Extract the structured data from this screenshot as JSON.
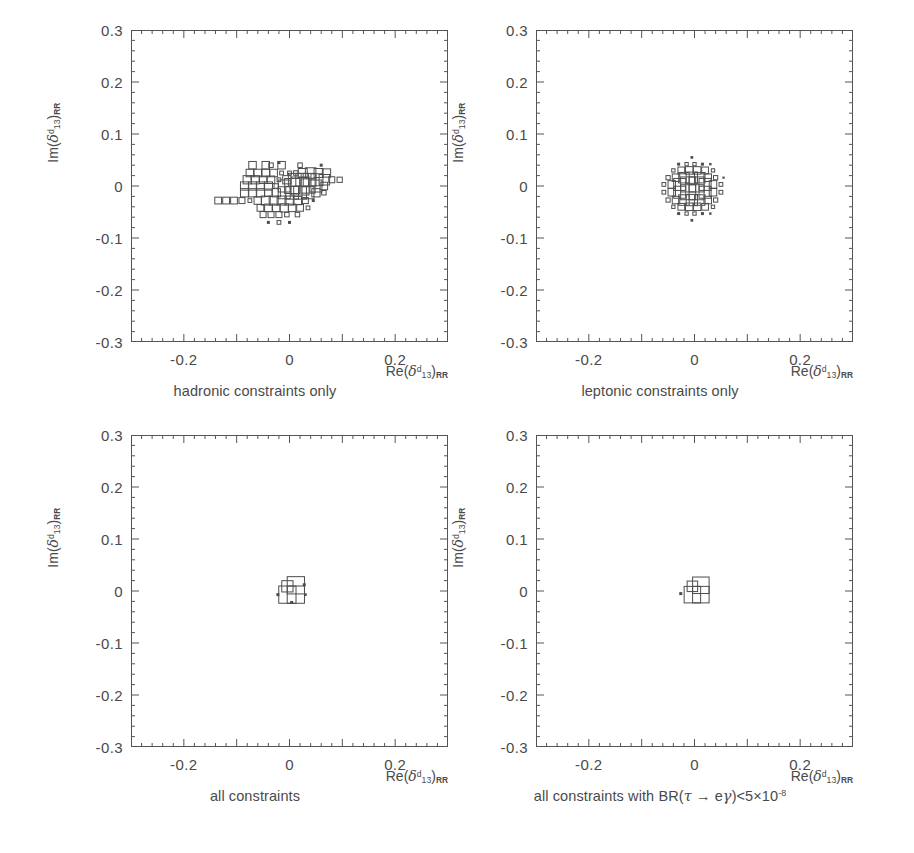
{
  "figure": {
    "axis": {
      "xlabel_parts": {
        "re": "Re(",
        "delta": "δ",
        "sup": "d",
        "sub": "13",
        "close": ")",
        "rr": "RR"
      },
      "ylabel_parts": {
        "im": "Im(",
        "delta": "δ",
        "sup": "d",
        "sub": "13",
        "close": ")",
        "rr": "RR"
      },
      "xticks": [
        "-0.2",
        "0",
        "0.2"
      ],
      "xtick_values": [
        -0.2,
        0,
        0.2
      ],
      "yticks": [
        "0.3",
        "0.2",
        "0.1",
        "0",
        "-0.1",
        "-0.2",
        "-0.3"
      ],
      "ytick_values": [
        0.3,
        0.2,
        0.1,
        0,
        -0.1,
        -0.2,
        -0.3
      ],
      "xlim": [
        -0.3,
        0.3
      ],
      "ylim": [
        -0.3,
        0.3
      ],
      "minor_ticks_per_major": 5
    },
    "panels": [
      {
        "id": "hadronic",
        "caption": "hadronic constraints only"
      },
      {
        "id": "leptonic",
        "caption": "leptonic constraints only"
      },
      {
        "id": "all",
        "caption": "all constraints"
      },
      {
        "id": "all-tau-egamma",
        "caption_prefix": "all constraints with BR(",
        "caption_tau": "τ",
        "caption_arrow": "→",
        "caption_egamma": "eγ",
        "caption_mid": ")<5×10",
        "caption_exp": "-8"
      }
    ],
    "colors": {
      "line": "#555555",
      "text": "#4a4a4a",
      "box": "#4d4d4d",
      "background": "#ffffff"
    }
  },
  "chart_data": [
    {
      "type": "heatmap",
      "title": "hadronic constraints only",
      "xlabel": "Re(delta^d_13)_RR",
      "ylabel": "Im(delta^d_13)_RR",
      "xlim": [
        -0.3,
        0.3
      ],
      "ylim": [
        -0.3,
        0.3
      ],
      "bin_size": 0.01,
      "style": "root-box-plot",
      "note": "Box side length proportional to bin content; irregular off-centre blob extending from Re=-0.14 to Re=+0.10, Im=-0.09 to Im=+0.05",
      "boxes": [
        {
          "x": -0.07,
          "y": 0.04,
          "w": 0.5
        },
        {
          "x": -0.045,
          "y": 0.04,
          "w": 0.5
        },
        {
          "x": -0.035,
          "y": 0.04,
          "w": 0.3
        },
        {
          "x": -0.02,
          "y": 0.045,
          "w": 0.2
        },
        {
          "x": -0.015,
          "y": 0.04,
          "w": 0.5
        },
        {
          "x": 0.02,
          "y": 0.04,
          "w": 0.3
        },
        {
          "x": 0.06,
          "y": 0.04,
          "w": 0.2
        },
        {
          "x": -0.075,
          "y": 0.025,
          "w": 0.5
        },
        {
          "x": -0.06,
          "y": 0.025,
          "w": 0.5
        },
        {
          "x": -0.045,
          "y": 0.025,
          "w": 0.5
        },
        {
          "x": -0.03,
          "y": 0.025,
          "w": 0.5
        },
        {
          "x": -0.015,
          "y": 0.025,
          "w": 0.25
        },
        {
          "x": 0.0,
          "y": 0.025,
          "w": 0.25
        },
        {
          "x": 0.012,
          "y": 0.025,
          "w": 0.3
        },
        {
          "x": 0.025,
          "y": 0.025,
          "w": 0.6
        },
        {
          "x": 0.04,
          "y": 0.025,
          "w": 0.7
        },
        {
          "x": 0.055,
          "y": 0.025,
          "w": 0.6
        },
        {
          "x": 0.07,
          "y": 0.025,
          "w": 0.55
        },
        {
          "x": -0.08,
          "y": 0.012,
          "w": 0.55
        },
        {
          "x": -0.065,
          "y": 0.012,
          "w": 0.55
        },
        {
          "x": -0.05,
          "y": 0.012,
          "w": 0.5
        },
        {
          "x": -0.035,
          "y": 0.012,
          "w": 0.5
        },
        {
          "x": -0.02,
          "y": 0.012,
          "w": 0.25
        },
        {
          "x": -0.005,
          "y": 0.012,
          "w": 0.55
        },
        {
          "x": 0.01,
          "y": 0.012,
          "w": 0.85
        },
        {
          "x": 0.024,
          "y": 0.012,
          "w": 0.85
        },
        {
          "x": 0.038,
          "y": 0.012,
          "w": 0.85
        },
        {
          "x": 0.052,
          "y": 0.012,
          "w": 0.8
        },
        {
          "x": 0.066,
          "y": 0.012,
          "w": 0.7
        },
        {
          "x": 0.08,
          "y": 0.012,
          "w": 0.4
        },
        {
          "x": 0.095,
          "y": 0.012,
          "w": 0.35
        },
        {
          "x": -0.085,
          "y": 0.0,
          "w": 0.55
        },
        {
          "x": -0.07,
          "y": 0.0,
          "w": 0.55
        },
        {
          "x": -0.055,
          "y": 0.0,
          "w": 0.55
        },
        {
          "x": -0.04,
          "y": 0.0,
          "w": 0.55
        },
        {
          "x": -0.025,
          "y": 0.0,
          "w": 0.3
        },
        {
          "x": -0.01,
          "y": 0.0,
          "w": 0.8
        },
        {
          "x": 0.005,
          "y": 0.0,
          "w": 1.0
        },
        {
          "x": 0.02,
          "y": 0.0,
          "w": 1.2
        },
        {
          "x": 0.035,
          "y": 0.0,
          "w": 0.95
        },
        {
          "x": 0.05,
          "y": 0.0,
          "w": 0.8
        },
        {
          "x": 0.065,
          "y": 0.0,
          "w": 0.5
        },
        {
          "x": -0.085,
          "y": -0.013,
          "w": 0.55
        },
        {
          "x": -0.07,
          "y": -0.013,
          "w": 0.55
        },
        {
          "x": -0.055,
          "y": -0.013,
          "w": 0.55
        },
        {
          "x": -0.04,
          "y": -0.013,
          "w": 0.5
        },
        {
          "x": -0.025,
          "y": -0.013,
          "w": 0.55
        },
        {
          "x": -0.01,
          "y": -0.013,
          "w": 0.8
        },
        {
          "x": 0.005,
          "y": -0.013,
          "w": 0.85
        },
        {
          "x": 0.02,
          "y": -0.013,
          "w": 0.85
        },
        {
          "x": 0.035,
          "y": -0.013,
          "w": 0.8
        },
        {
          "x": 0.05,
          "y": -0.013,
          "w": 0.55
        },
        {
          "x": 0.065,
          "y": -0.013,
          "w": 0.3
        },
        {
          "x": -0.135,
          "y": -0.028,
          "w": 0.45
        },
        {
          "x": -0.12,
          "y": -0.028,
          "w": 0.45
        },
        {
          "x": -0.105,
          "y": -0.028,
          "w": 0.45
        },
        {
          "x": -0.09,
          "y": -0.028,
          "w": 0.4
        },
        {
          "x": -0.075,
          "y": -0.028,
          "w": 0.25
        },
        {
          "x": -0.06,
          "y": -0.028,
          "w": 0.5
        },
        {
          "x": -0.045,
          "y": -0.028,
          "w": 0.6
        },
        {
          "x": -0.03,
          "y": -0.028,
          "w": 0.6
        },
        {
          "x": -0.015,
          "y": -0.028,
          "w": 0.6
        },
        {
          "x": 0.0,
          "y": -0.028,
          "w": 0.6
        },
        {
          "x": 0.015,
          "y": -0.028,
          "w": 0.55
        },
        {
          "x": 0.03,
          "y": -0.028,
          "w": 0.4
        },
        {
          "x": 0.045,
          "y": -0.028,
          "w": 0.2
        },
        {
          "x": -0.055,
          "y": -0.042,
          "w": 0.45
        },
        {
          "x": -0.04,
          "y": -0.042,
          "w": 0.5
        },
        {
          "x": -0.025,
          "y": -0.042,
          "w": 0.5
        },
        {
          "x": -0.01,
          "y": -0.042,
          "w": 0.55
        },
        {
          "x": 0.005,
          "y": -0.042,
          "w": 0.5
        },
        {
          "x": 0.02,
          "y": -0.042,
          "w": 0.45
        },
        {
          "x": 0.035,
          "y": -0.042,
          "w": 0.25
        },
        {
          "x": -0.05,
          "y": -0.055,
          "w": 0.4
        },
        {
          "x": -0.035,
          "y": -0.055,
          "w": 0.4
        },
        {
          "x": -0.02,
          "y": -0.055,
          "w": 0.4
        },
        {
          "x": -0.005,
          "y": -0.055,
          "w": 0.3
        },
        {
          "x": 0.015,
          "y": -0.055,
          "w": 0.3
        },
        {
          "x": -0.04,
          "y": -0.07,
          "w": 0.2
        },
        {
          "x": -0.02,
          "y": -0.07,
          "w": 0.25
        },
        {
          "x": 0.0,
          "y": -0.07,
          "w": 0.2
        }
      ]
    },
    {
      "type": "heatmap",
      "title": "leptonic constraints only",
      "xlabel": "Re(delta^d_13)_RR",
      "ylabel": "Im(delta^d_13)_RR",
      "xlim": [
        -0.3,
        0.3
      ],
      "ylim": [
        -0.3,
        0.3
      ],
      "bin_size": 0.01,
      "style": "root-box-plot",
      "note": "Compact, nearly circular symmetric blob centred at origin, radius ~0.05",
      "boxes": [
        {
          "x": -0.005,
          "y": 0.055,
          "w": 0.18
        },
        {
          "x": -0.03,
          "y": 0.042,
          "w": 0.2
        },
        {
          "x": -0.015,
          "y": 0.042,
          "w": 0.22
        },
        {
          "x": 0.0,
          "y": 0.042,
          "w": 0.22
        },
        {
          "x": 0.015,
          "y": 0.042,
          "w": 0.2
        },
        {
          "x": 0.03,
          "y": 0.042,
          "w": 0.16
        },
        {
          "x": -0.04,
          "y": 0.03,
          "w": 0.22
        },
        {
          "x": -0.025,
          "y": 0.03,
          "w": 0.45
        },
        {
          "x": -0.01,
          "y": 0.03,
          "w": 0.5
        },
        {
          "x": 0.005,
          "y": 0.03,
          "w": 0.5
        },
        {
          "x": 0.02,
          "y": 0.03,
          "w": 0.45
        },
        {
          "x": 0.035,
          "y": 0.03,
          "w": 0.22
        },
        {
          "x": -0.05,
          "y": 0.016,
          "w": 0.28
        },
        {
          "x": -0.035,
          "y": 0.016,
          "w": 0.5
        },
        {
          "x": -0.02,
          "y": 0.016,
          "w": 0.7
        },
        {
          "x": -0.005,
          "y": 0.016,
          "w": 0.75
        },
        {
          "x": 0.01,
          "y": 0.016,
          "w": 0.7
        },
        {
          "x": 0.025,
          "y": 0.016,
          "w": 0.5
        },
        {
          "x": 0.04,
          "y": 0.016,
          "w": 0.28
        },
        {
          "x": 0.055,
          "y": 0.016,
          "w": 0.15
        },
        {
          "x": -0.058,
          "y": 0.003,
          "w": 0.25
        },
        {
          "x": -0.043,
          "y": 0.003,
          "w": 0.5
        },
        {
          "x": -0.028,
          "y": 0.003,
          "w": 0.8
        },
        {
          "x": -0.012,
          "y": 0.003,
          "w": 1.0
        },
        {
          "x": 0.004,
          "y": 0.003,
          "w": 1.0
        },
        {
          "x": 0.02,
          "y": 0.003,
          "w": 0.8
        },
        {
          "x": 0.035,
          "y": 0.003,
          "w": 0.5
        },
        {
          "x": 0.05,
          "y": 0.003,
          "w": 0.25
        },
        {
          "x": -0.058,
          "y": -0.012,
          "w": 0.25
        },
        {
          "x": -0.043,
          "y": -0.012,
          "w": 0.5
        },
        {
          "x": -0.028,
          "y": -0.012,
          "w": 0.8
        },
        {
          "x": -0.012,
          "y": -0.012,
          "w": 1.0
        },
        {
          "x": 0.004,
          "y": -0.012,
          "w": 1.0
        },
        {
          "x": 0.02,
          "y": -0.012,
          "w": 0.8
        },
        {
          "x": 0.035,
          "y": -0.012,
          "w": 0.5
        },
        {
          "x": 0.05,
          "y": -0.012,
          "w": 0.25
        },
        {
          "x": -0.05,
          "y": -0.027,
          "w": 0.28
        },
        {
          "x": -0.035,
          "y": -0.027,
          "w": 0.5
        },
        {
          "x": -0.02,
          "y": -0.027,
          "w": 0.7
        },
        {
          "x": -0.005,
          "y": -0.027,
          "w": 0.75
        },
        {
          "x": 0.01,
          "y": -0.027,
          "w": 0.7
        },
        {
          "x": 0.025,
          "y": -0.027,
          "w": 0.5
        },
        {
          "x": 0.04,
          "y": -0.027,
          "w": 0.28
        },
        {
          "x": -0.04,
          "y": -0.04,
          "w": 0.22
        },
        {
          "x": -0.025,
          "y": -0.04,
          "w": 0.45
        },
        {
          "x": -0.01,
          "y": -0.04,
          "w": 0.5
        },
        {
          "x": 0.005,
          "y": -0.04,
          "w": 0.5
        },
        {
          "x": 0.02,
          "y": -0.04,
          "w": 0.45
        },
        {
          "x": 0.035,
          "y": -0.04,
          "w": 0.22
        },
        {
          "x": -0.03,
          "y": -0.053,
          "w": 0.2
        },
        {
          "x": -0.015,
          "y": -0.053,
          "w": 0.22
        },
        {
          "x": 0.0,
          "y": -0.053,
          "w": 0.22
        },
        {
          "x": 0.015,
          "y": -0.053,
          "w": 0.2
        },
        {
          "x": 0.03,
          "y": -0.053,
          "w": 0.16
        },
        {
          "x": -0.005,
          "y": -0.066,
          "w": 0.18
        }
      ]
    },
    {
      "type": "heatmap",
      "title": "all constraints",
      "xlabel": "Re(delta^d_13)_RR",
      "ylabel": "Im(delta^d_13)_RR",
      "xlim": [
        -0.3,
        0.3
      ],
      "ylim": [
        -0.3,
        0.3
      ],
      "bin_size": 0.01,
      "style": "root-box-plot",
      "note": "Very small cluster of 3-4 bins at the origin",
      "boxes": [
        {
          "x": -0.004,
          "y": 0.009,
          "w": 0.75
        },
        {
          "x": 0.012,
          "y": 0.011,
          "w": 1.15
        },
        {
          "x": -0.004,
          "y": -0.007,
          "w": 1.15
        },
        {
          "x": 0.012,
          "y": -0.007,
          "w": 1.15
        },
        {
          "x": 0.028,
          "y": 0.012,
          "w": 0.2
        },
        {
          "x": -0.022,
          "y": -0.007,
          "w": 0.2
        },
        {
          "x": 0.03,
          "y": -0.007,
          "w": 0.18
        },
        {
          "x": 0.004,
          "y": -0.022,
          "w": 0.2
        }
      ]
    },
    {
      "type": "heatmap",
      "title": "all constraints with BR(tau -> e gamma) < 5e-8",
      "xlabel": "Re(delta^d_13)_RR",
      "ylabel": "Im(delta^d_13)_RR",
      "xlim": [
        -0.3,
        0.3
      ],
      "ylim": [
        -0.3,
        0.3
      ],
      "bin_size": 0.01,
      "style": "root-box-plot",
      "note": "Very small cluster of 3-4 bins at the origin, slightly sparser than panel 3",
      "boxes": [
        {
          "x": -0.004,
          "y": 0.009,
          "w": 0.7
        },
        {
          "x": 0.012,
          "y": 0.011,
          "w": 1.1
        },
        {
          "x": -0.004,
          "y": -0.007,
          "w": 1.1
        },
        {
          "x": 0.012,
          "y": -0.007,
          "w": 1.1
        },
        {
          "x": -0.026,
          "y": -0.005,
          "w": 0.2
        }
      ]
    }
  ]
}
